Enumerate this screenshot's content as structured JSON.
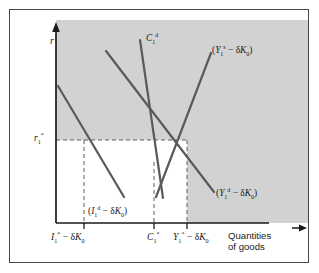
{
  "figure": {
    "type": "economics-diagram",
    "background_color": "#ffffff",
    "frame_color": "#4a4a4a",
    "shaded_region_color": "#d2d2d2",
    "curve_color": "#5a5a5a",
    "axis_color": "#1a1a1a",
    "dashed_color": "#6b6b6b"
  },
  "axes": {
    "y_axis_symbol": "r",
    "y_axis_name": "real-interest-rate",
    "x_axis_title_line1": "Quantities",
    "x_axis_title_line2": "of goods",
    "x_axis_arrow": "→",
    "y_axis_arrow": "↑"
  },
  "y_ticks": [
    {
      "name": "equilibrium-interest-rate",
      "base": "r",
      "sub": "1",
      "sup": "*"
    }
  ],
  "x_ticks": [
    {
      "name": "investment-tick",
      "text_html": "<i>I</i><sub>1</sub><sup>*</sup> − δ<i>K</i><sub>0</sub>",
      "plain": "I1* − δK0"
    },
    {
      "name": "consumption-tick",
      "text_html": "<i>C</i><sub>1</sub><sup>*</sup>",
      "plain": "C1*"
    },
    {
      "name": "output-tick",
      "text_html": "<i>Y</i><sub>1</sub><sup>*</sup> − δ<i>K</i><sub>0</sub>",
      "plain": "Y1* − δK0"
    }
  ],
  "curve_labels": [
    {
      "name": "desired-consumption-label",
      "text_html": "<i>C</i><sub>1</sub><sup>d</sup>",
      "plain": "C1d"
    },
    {
      "name": "output-supply-label",
      "text_html": "(<i>Y</i><sub>1</sub><sup>s</sup> − δ<i>K</i><sub>0</sub>)",
      "plain": "(Y1s − δK0)"
    },
    {
      "name": "output-demand-label",
      "text_html": "(<i>Y</i><sub>1</sub><sup>d</sup> − δ<i>K</i><sub>0</sub>)",
      "plain": "(Y1d − δK0)"
    },
    {
      "name": "desired-investment-label",
      "text_html": "(<i>I</i><sub>1</sub><sup>d</sup> − δ<i>K</i><sub>0</sub>)",
      "plain": "(I1d − δK0)"
    }
  ],
  "chart_data": {
    "type": "line",
    "title": "",
    "xlabel": "Quantities of goods",
    "ylabel": "r",
    "xlim": [
      0,
      100
    ],
    "ylim": [
      0,
      100
    ],
    "grid": false,
    "legend": "inline-curve-labels",
    "shaded_region": {
      "name": "shaded-background",
      "note": "Grey fill covers plot area except the white rectangle under r1* left of Y1*"
    },
    "series": [
      {
        "name": "desired-investment",
        "label": "(I1d − δK0)",
        "slope": "downward",
        "points_px": [
          [
            57,
            85
          ],
          [
            123,
            196
          ]
        ]
      },
      {
        "name": "output-demand",
        "label": "(Y1d − δK0)",
        "slope": "downward",
        "points_px": [
          [
            105,
            50
          ],
          [
            213,
            191
          ]
        ]
      },
      {
        "name": "desired-consumption",
        "label": "C1d",
        "slope": "steep-downward",
        "points_px": [
          [
            139,
            39
          ],
          [
            162,
            197
          ]
        ]
      },
      {
        "name": "output-supply",
        "label": "(Y1s − δK0)",
        "slope": "upward",
        "points_px": [
          [
            155,
            196
          ],
          [
            210,
            52
          ]
        ]
      }
    ],
    "equilibrium_point_px": [
      186,
      139
    ],
    "annotations": [
      "Equilibrium where output supply meets output demand at r1* and Y1* − δK0",
      "Desired consumption C1* read on horizontal axis",
      "Desired investment I1* − δK0 read on horizontal axis"
    ]
  }
}
